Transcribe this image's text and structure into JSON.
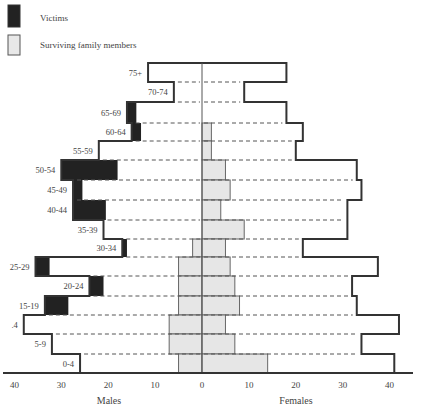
{
  "chart_data": {
    "type": "bar",
    "subtype": "population-pyramid",
    "title": "",
    "legend": {
      "position": "top-left",
      "entries": [
        {
          "name": "Victims",
          "color": "#222222"
        },
        {
          "name": "Surviving family members",
          "color": "#e6e6e6"
        }
      ]
    },
    "categories": [
      "75+",
      "70-74",
      "65-69",
      "60-64",
      "55-59",
      "50-54",
      "45-49",
      "40-44",
      "35-39",
      "30-34",
      "25-29",
      "20-24",
      "15-19",
      "10-14",
      "5-9",
      "0-4"
    ],
    "category_labels_visible": [
      "75+",
      "70-74",
      "65-69",
      "60-64",
      "55-59",
      "50-54",
      "45-49",
      "40-44",
      "35-39",
      "30-34",
      "25-29",
      "20-24",
      "15-19",
      ".4",
      "5-9",
      "0-4"
    ],
    "males": {
      "label": "Males",
      "total": [
        11.5,
        6,
        16,
        15,
        22,
        30,
        27.5,
        27.5,
        21,
        17,
        35.5,
        24,
        33.5,
        38,
        32,
        26
      ],
      "victims": [
        0,
        0,
        2,
        2,
        0,
        12,
        2,
        7,
        0,
        1,
        3,
        3,
        5,
        0,
        0,
        0
      ],
      "surviving_family": [
        0,
        0,
        0,
        0,
        0,
        0,
        0,
        0,
        0,
        2,
        5,
        5,
        5,
        7,
        7,
        5
      ]
    },
    "females": {
      "label": "Females",
      "total": [
        18,
        9,
        18,
        21.5,
        20,
        33,
        34,
        31,
        31,
        21.5,
        37.5,
        32,
        33,
        42,
        34,
        41
      ],
      "victims": [
        0,
        0,
        0,
        0,
        0,
        0,
        0,
        0,
        0,
        0,
        0,
        0,
        0,
        0,
        0,
        0
      ],
      "surviving_family": [
        0,
        0,
        0,
        2,
        2,
        5,
        6,
        4,
        9,
        5,
        6,
        7,
        8,
        5,
        7,
        14
      ]
    },
    "x_axis": {
      "ticks_left": [
        40,
        30,
        20,
        10,
        0
      ],
      "ticks_right": [
        10,
        20,
        30,
        40
      ],
      "range": [
        -40,
        40
      ],
      "left_label": "Males",
      "right_label": "Females"
    },
    "grid": false
  }
}
